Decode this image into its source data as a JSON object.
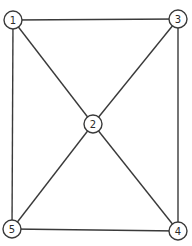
{
  "graph": {
    "nodes": [
      {
        "id": "1",
        "label": "1"
      },
      {
        "id": "2",
        "label": "2"
      },
      {
        "id": "3",
        "label": "3"
      },
      {
        "id": "4",
        "label": "4"
      },
      {
        "id": "5",
        "label": "5"
      }
    ],
    "edges": [
      [
        "1",
        "3"
      ],
      [
        "1",
        "5"
      ],
      [
        "3",
        "4"
      ],
      [
        "5",
        "4"
      ],
      [
        "1",
        "2"
      ],
      [
        "3",
        "2"
      ],
      [
        "5",
        "2"
      ],
      [
        "4",
        "2"
      ]
    ],
    "colors": {
      "stroke": "#3a3a3a",
      "fill": "#ffffff"
    }
  }
}
